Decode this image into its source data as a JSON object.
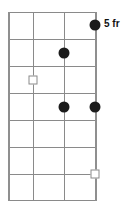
{
  "diagram": {
    "type": "fretboard-chord-diagram",
    "orientation": "vertical",
    "position_label": "5 fr",
    "string_count": 4,
    "fret_count": 7,
    "colors": {
      "grid": "#8a8a8a",
      "dot_fill": "#1c1c1c",
      "square_fill": "#ffffff",
      "square_border": "#8a8a8a",
      "label_text": "#111111",
      "background": "#ffffff"
    },
    "geometry": {
      "strings_x": [
        8,
        33,
        64,
        95
      ],
      "frets_y": [
        12,
        39,
        66,
        93,
        120,
        147,
        174,
        200
      ]
    },
    "markers": [
      {
        "id": "m1",
        "shape": "dot",
        "string": 4,
        "fret": 1,
        "x": 95,
        "y": 25
      },
      {
        "id": "m2",
        "shape": "dot",
        "string": 3,
        "fret": 2,
        "x": 64,
        "y": 53
      },
      {
        "id": "m3",
        "shape": "square",
        "string": 2,
        "fret": 3,
        "x": 33,
        "y": 80
      },
      {
        "id": "m4",
        "shape": "dot",
        "string": 3,
        "fret": 4,
        "x": 64,
        "y": 107
      },
      {
        "id": "m5",
        "shape": "dot",
        "string": 4,
        "fret": 4,
        "x": 95,
        "y": 107
      },
      {
        "id": "m6",
        "shape": "square",
        "string": 4,
        "fret": 7,
        "x": 95,
        "y": 174
      }
    ],
    "label_position": {
      "x": 104,
      "y": 19
    }
  }
}
